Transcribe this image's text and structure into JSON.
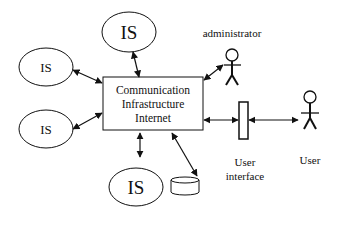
{
  "diagram": {
    "type": "architecture",
    "center": {
      "lines": [
        "Communication",
        "Infrastructure",
        "Internet"
      ]
    },
    "nodes": {
      "is_top": "IS",
      "is_left_upper": "IS",
      "is_left_lower": "IS",
      "is_bottom": "IS"
    },
    "actors": {
      "administrator": "administrator",
      "user": "User"
    },
    "user_interface": {
      "line1": "User",
      "line2": "interface"
    },
    "database": "database",
    "edges": [
      {
        "from": "is_top",
        "to": "center",
        "type": "bidirectional"
      },
      {
        "from": "is_left_upper",
        "to": "center",
        "type": "bidirectional"
      },
      {
        "from": "is_left_lower",
        "to": "center",
        "type": "bidirectional"
      },
      {
        "from": "is_bottom",
        "to": "center",
        "type": "bidirectional"
      },
      {
        "from": "administrator",
        "to": "center",
        "type": "bidirectional"
      },
      {
        "from": "database",
        "to": "center",
        "type": "bidirectional"
      },
      {
        "from": "user_interface",
        "to": "center",
        "type": "bidirectional"
      },
      {
        "from": "user",
        "to": "user_interface",
        "type": "bidirectional"
      }
    ],
    "colors": {
      "stroke": "#111111",
      "background": "#ffffff"
    }
  }
}
